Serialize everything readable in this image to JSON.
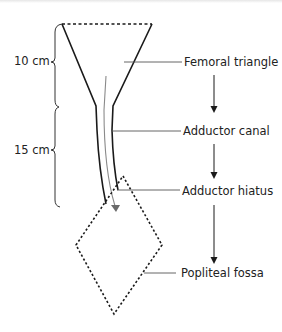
{
  "diagram": {
    "type": "anatomical-pathway",
    "dimensions": [
      {
        "label": "10 cm",
        "segment": "femoral-triangle"
      },
      {
        "label": "15 cm",
        "segment": "adductor-canal"
      }
    ],
    "labels": [
      {
        "id": "femoral-triangle",
        "text": "Femoral triangle"
      },
      {
        "id": "adductor-canal",
        "text": "Adductor canal"
      },
      {
        "id": "adductor-hiatus",
        "text": "Adductor hiatus"
      },
      {
        "id": "popliteal-fossa",
        "text": "Popliteal fossa"
      }
    ],
    "flow": [
      "Femoral triangle",
      "Adductor canal",
      "Adductor hiatus",
      "Popliteal fossa"
    ],
    "colors": {
      "line": "#1a1a1a",
      "inner_path": "#8a8a8a",
      "leader": "#555555",
      "text": "#222222"
    }
  }
}
